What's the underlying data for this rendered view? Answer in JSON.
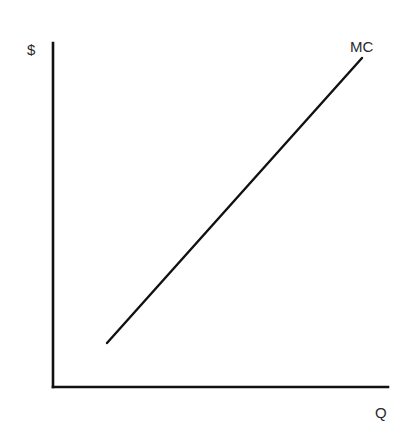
{
  "chart_data": {
    "type": "line",
    "title": "",
    "xlabel": "Q",
    "ylabel": "$",
    "grid": false,
    "legend": null,
    "axes": {
      "origin_px": [
        53,
        387
      ],
      "y_axis_top_px": [
        53,
        43
      ],
      "x_axis_right_px": [
        388,
        387
      ]
    },
    "series": [
      {
        "name": "MC",
        "label": "MC",
        "points_px": [
          [
            107,
            343
          ],
          [
            362,
            58
          ]
        ],
        "description": "Upward-sloping straight marginal cost curve"
      }
    ],
    "colors": {
      "axis": "#111111",
      "line": "#111111",
      "text": "#2a2a2a",
      "background": "#ffffff"
    }
  }
}
